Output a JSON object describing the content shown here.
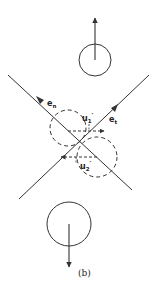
{
  "figure": {
    "panel_label": "(b)",
    "labels": {
      "e_n": {
        "main": "e",
        "sub": "n"
      },
      "e_t": {
        "main": "e",
        "sub": "t"
      },
      "u1": {
        "main": "u",
        "sub": "1",
        "prime": "′"
      },
      "u2": {
        "main": "u",
        "sub": "2",
        "prime": "′"
      }
    },
    "colors": {
      "stroke": "#333333",
      "background": "#ffffff"
    },
    "elements": {
      "top_particle": {
        "shape": "circle",
        "velocity": "up"
      },
      "bottom_particle": {
        "shape": "circle",
        "velocity": "down"
      },
      "collision_particle_1": {
        "shape": "dashed-circle"
      },
      "collision_particle_2": {
        "shape": "dashed-circle"
      },
      "normal_axis": "e_n",
      "tangent_axis": "e_t"
    }
  }
}
